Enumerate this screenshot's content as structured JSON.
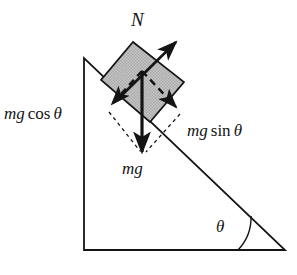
{
  "figure": {
    "type": "physics-force-diagram",
    "background_color": "#ffffff",
    "stroke_color": "#141414"
  },
  "labels": {
    "normal_force": "N",
    "weight": "mg",
    "weight_perpendicular_component": "mg cos θ",
    "weight_parallel_component": "mg sin θ",
    "incline_angle": "θ",
    "mg_cos_parts": {
      "scalar": "mg",
      "function": "cos",
      "angle": "θ"
    },
    "mg_sin_parts": {
      "scalar": "mg",
      "function": "sin",
      "angle": "θ"
    }
  },
  "geometry": {
    "incline": {
      "apex": [
        84,
        58
      ],
      "bottom_left": [
        84,
        250
      ],
      "bottom_right": [
        285,
        250
      ],
      "angle_degrees": 44,
      "fill": "none",
      "stroke": "#141414",
      "stroke_width": 1.8
    },
    "block": {
      "corner_top": [
        133,
        42
      ],
      "corner_right": [
        184,
        82
      ],
      "corner_bottom": [
        150,
        122
      ],
      "corner_left": [
        101,
        80
      ],
      "fill": "#bdbdbd",
      "stroke": "#141414",
      "stroke_width": 1.6,
      "rotation_degrees": 44
    },
    "angle_arc": {
      "vertex": [
        285,
        250
      ],
      "radius": 47,
      "stroke": "#141414",
      "stroke_width": 1.4
    }
  },
  "vectors": [
    {
      "name": "normal-force-vector",
      "label": "N",
      "style": "solid",
      "from": [
        124,
        93
      ],
      "to": [
        178,
        40
      ],
      "stroke": "#141414",
      "stroke_width": 2.6
    },
    {
      "name": "weight-vector",
      "label": "mg",
      "style": "solid",
      "from": [
        142,
        71
      ],
      "to": [
        142,
        157
      ],
      "stroke": "#141414",
      "stroke_width": 3.0
    },
    {
      "name": "weight-perpendicular-vector",
      "label": "mg cos θ",
      "style": "dashed",
      "from": [
        142,
        71
      ],
      "to": [
        109,
        108
      ],
      "stroke": "#141414",
      "stroke_width": 2.6
    },
    {
      "name": "weight-parallel-vector",
      "label": "mg sin θ",
      "style": "dashed",
      "from": [
        142,
        71
      ],
      "to": [
        179,
        110
      ],
      "stroke": "#141414",
      "stroke_width": 2.6
    }
  ],
  "construction_lines": [
    {
      "name": "parallelogram-side-left",
      "style": "dotted",
      "from": [
        109,
        112
      ],
      "to": [
        141,
        151
      ]
    },
    {
      "name": "parallelogram-side-right",
      "style": "dotted",
      "from": [
        180,
        114
      ],
      "to": [
        145,
        152
      ]
    }
  ]
}
